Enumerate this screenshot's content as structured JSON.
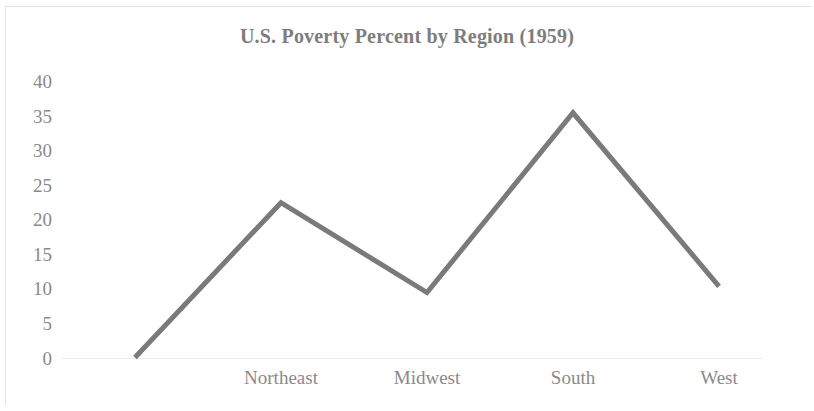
{
  "chart_data": {
    "type": "line",
    "title": "U.S. Poverty Percent by Region (1959)",
    "xlabel": "",
    "ylabel": "",
    "categories": [
      "",
      "Northeast",
      "Midwest",
      "South",
      "West"
    ],
    "values": [
      0,
      22.4,
      9.4,
      35.4,
      10.3
    ],
    "series": [
      {
        "name": "Poverty Percent",
        "values": [
          0,
          22.4,
          9.4,
          35.4,
          10.3
        ],
        "color": "#7a7a7a"
      }
    ],
    "x_tick_labels": [
      "Northeast",
      "Midwest",
      "South",
      "West"
    ],
    "y_tick_labels": [
      "40",
      "35",
      "30",
      "25",
      "20",
      "15",
      "10",
      "5",
      "0"
    ],
    "y_ticks": [
      40,
      35,
      30,
      25,
      20,
      15,
      10,
      5,
      0
    ],
    "ylim": [
      0,
      40
    ],
    "grid": false,
    "legend": false,
    "legend_position": "none",
    "line_color": "#7a7a7a",
    "line_width": 5,
    "title_color": "#7d7d7d",
    "tick_label_color": "#8a8a8a",
    "background_color": "#ffffff"
  },
  "figure": {
    "title": "U.S. Poverty Percent by Region (1959)"
  }
}
